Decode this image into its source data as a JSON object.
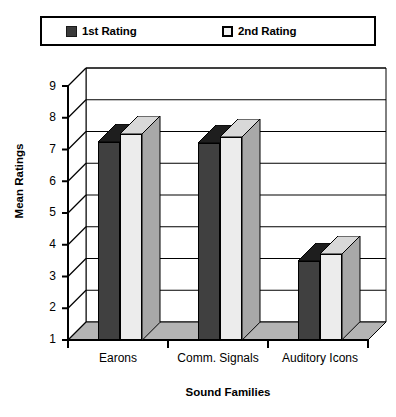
{
  "legend": {
    "entries": [
      {
        "label": "1st Rating",
        "swatch": "dark-square-icon",
        "color": "#404040"
      },
      {
        "label": "2nd Rating",
        "swatch": "light-square-icon",
        "color": "#ececec"
      }
    ]
  },
  "chart_data": {
    "type": "bar",
    "title": "",
    "xlabel": "Sound Families",
    "ylabel": "Mean Ratings",
    "categories": [
      "Earons",
      "Comm. Signals",
      "Auditory Icons"
    ],
    "series": [
      {
        "name": "1st Rating",
        "values": [
          7.25,
          7.2,
          3.5
        ],
        "color": "#404040"
      },
      {
        "name": "2nd Rating",
        "values": [
          7.5,
          7.4,
          3.7
        ],
        "color": "#ececec"
      }
    ],
    "ylim": [
      1,
      9
    ],
    "yticks": [
      1,
      2,
      3,
      4,
      5,
      6,
      7,
      8,
      9
    ],
    "ytick_labels": [
      "1",
      "2",
      "3",
      "4",
      "5",
      "6",
      "7",
      "8",
      "9"
    ],
    "grid": true,
    "grid_axis": "y",
    "legend_position": "top",
    "style": "3d-column"
  }
}
